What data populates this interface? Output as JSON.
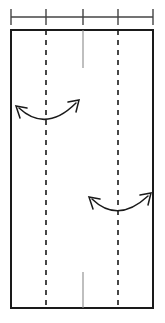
{
  "canvas": {
    "width": 165,
    "height": 323,
    "background": "#ffffff"
  },
  "scale_bar": {
    "name": "horizontal-scale-bar",
    "axis_y": 17,
    "x_start": 11,
    "x_end": 153,
    "color": "#444444",
    "line_width": 1.4,
    "tick_half_height": 8,
    "tick_positions": [
      11,
      46,
      83,
      118,
      153
    ],
    "segment_count": 4
  },
  "panel": {
    "name": "main-rectangle",
    "x": 11,
    "y": 30,
    "width": 142,
    "height": 278,
    "stroke": "#1a1a1a",
    "stroke_width": 2,
    "fill": "#ffffff"
  },
  "dashed_lines": [
    {
      "name": "dashed-guide-left",
      "x": 46,
      "y_top": 30,
      "y_bottom": 308,
      "stroke": "#1a1a1a",
      "stroke_width": 1.6,
      "dash": "5,5"
    },
    {
      "name": "dashed-guide-right",
      "x": 118,
      "y_top": 30,
      "y_bottom": 308,
      "stroke": "#1a1a1a",
      "stroke_width": 1.6,
      "dash": "5,5"
    }
  ],
  "center_marks": [
    {
      "name": "center-tick-top",
      "x": 83,
      "y_top": 30,
      "y_bottom": 68,
      "stroke": "#8a8a8a",
      "stroke_width": 1.1
    },
    {
      "name": "center-tick-bottom",
      "x": 83,
      "y_top": 272,
      "y_bottom": 308,
      "stroke": "#8a8a8a",
      "stroke_width": 1.1
    }
  ],
  "arrows": [
    {
      "name": "curved-double-arrow-upper",
      "stroke": "#1a1a1a",
      "stroke_width": 1.5,
      "head_style": "open",
      "curve": "M 19 108 Q 46 133 76 103",
      "centered_on": 46,
      "head_start": {
        "tip_x": 16,
        "tip_y": 106,
        "barb1_x": 27,
        "barb1_y": 108,
        "barb2_x": 20,
        "barb2_y": 118
      },
      "head_end": {
        "tip_x": 79,
        "tip_y": 100,
        "barb1_x": 68,
        "barb1_y": 102,
        "barb2_x": 76,
        "barb2_y": 112
      }
    },
    {
      "name": "curved-double-arrow-lower",
      "stroke": "#1a1a1a",
      "stroke_width": 1.5,
      "head_style": "open",
      "curve": "M 92 199 Q 118 224 148 196",
      "centered_on": 118,
      "head_start": {
        "tip_x": 89,
        "tip_y": 197,
        "barb1_x": 100,
        "barb1_y": 199,
        "barb2_x": 93,
        "barb2_y": 209
      },
      "head_end": {
        "tip_x": 151,
        "tip_y": 193,
        "barb1_x": 140,
        "barb1_y": 195,
        "barb2_x": 148,
        "barb2_y": 205
      }
    }
  ]
}
